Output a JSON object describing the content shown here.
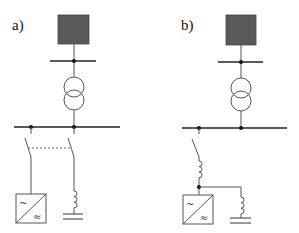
{
  "figure": {
    "panels": [
      {
        "id": "a",
        "label": "a)",
        "components": [
          "grid-source",
          "upper-bus",
          "transformer",
          "main-bus",
          "ganged-switches",
          "converter",
          "filter-inductor",
          "ground"
        ],
        "converter": {
          "ac_symbol": "~",
          "dc_symbol": "≈"
        }
      },
      {
        "id": "b",
        "label": "b)",
        "components": [
          "grid-source",
          "upper-bus",
          "transformer",
          "main-bus",
          "switch",
          "series-inductor",
          "converter",
          "shunt-inductor",
          "ground"
        ],
        "converter": {
          "ac_symbol": "~",
          "dc_symbol": "≈"
        }
      }
    ],
    "colors": {
      "source_fill": "#5a5a5a",
      "wire": "#555555",
      "bus": "#222222",
      "background": "#ffffff"
    }
  }
}
